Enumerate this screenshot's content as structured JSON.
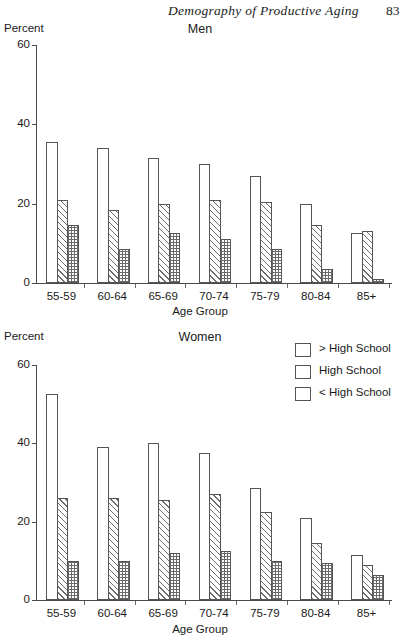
{
  "running_head": {
    "title": "Demography of Productive Aging",
    "page_number": "83"
  },
  "axis_titles": {
    "y": "Percent",
    "x": "Age Group"
  },
  "legend": {
    "items": [
      {
        "label": "> High School",
        "pattern": "plain"
      },
      {
        "label": "High School",
        "pattern": "hatch"
      },
      {
        "label": "< High School",
        "pattern": "cross"
      }
    ]
  },
  "chart_data": [
    {
      "type": "bar",
      "title": "Men",
      "xlabel": "Age Group",
      "ylabel": "Percent",
      "ylim": [
        0,
        60
      ],
      "yticks": [
        0,
        20,
        40,
        60
      ],
      "grid": false,
      "legend_position": "right",
      "categories": [
        "55-59",
        "60-64",
        "65-69",
        "70-74",
        "75-79",
        "80-84",
        "85+"
      ],
      "series": [
        {
          "name": "> High School",
          "values": [
            35.5,
            34,
            31.5,
            30,
            27,
            20,
            12.5
          ]
        },
        {
          "name": "High School",
          "values": [
            21,
            18.5,
            20,
            21,
            20.5,
            14.5,
            13
          ]
        },
        {
          "name": "< High School",
          "values": [
            14.5,
            8.5,
            12.5,
            11,
            8.5,
            3.5,
            1
          ]
        }
      ]
    },
    {
      "type": "bar",
      "title": "Women",
      "xlabel": "Age Group",
      "ylabel": "Percent",
      "ylim": [
        0,
        60
      ],
      "yticks": [
        0,
        20,
        40,
        60
      ],
      "grid": false,
      "legend_position": "right",
      "categories": [
        "55-59",
        "60-64",
        "65-69",
        "70-74",
        "75-79",
        "80-84",
        "85+"
      ],
      "series": [
        {
          "name": "> High School",
          "values": [
            52.5,
            39,
            40,
            37.5,
            28.5,
            21,
            11.5
          ]
        },
        {
          "name": "High School",
          "values": [
            26,
            26,
            25.5,
            27,
            22.5,
            14.5,
            9
          ]
        },
        {
          "name": "< High School",
          "values": [
            10,
            10,
            12,
            12.5,
            10,
            9.5,
            6.5
          ]
        }
      ]
    }
  ],
  "ytick_labels": [
    "60",
    "40",
    "20",
    "0"
  ]
}
